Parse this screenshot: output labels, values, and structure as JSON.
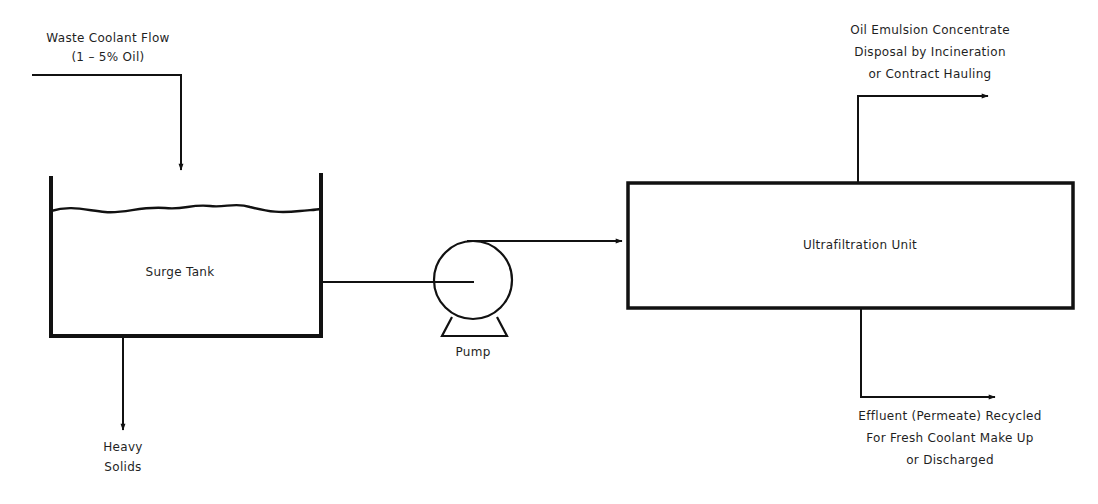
{
  "diagram": {
    "type": "process-flow",
    "colors": {
      "line": "#111111",
      "text": "#1f1f1f",
      "background": "#ffffff"
    },
    "inlet": {
      "label_line1": "Waste Coolant Flow",
      "label_line2": "(1 – 5% Oil)"
    },
    "surge_tank": {
      "label": "Surge Tank"
    },
    "heavy_solids": {
      "label_line1": "Heavy",
      "label_line2": "Solids"
    },
    "pump": {
      "label": "Pump"
    },
    "ultrafiltration": {
      "label": "Ultrafiltration Unit"
    },
    "concentrate_outlet": {
      "label_line1": "Oil Emulsion Concentrate",
      "label_line2": "Disposal by Incineration",
      "label_line3": "or Contract Hauling"
    },
    "permeate_outlet": {
      "label_line1": "Effluent (Permeate) Recycled",
      "label_line2": "For Fresh Coolant Make Up",
      "label_line3": "or Discharged"
    },
    "flows": [
      {
        "from": "Waste Coolant Flow",
        "to": "Surge Tank"
      },
      {
        "from": "Surge Tank",
        "to": "Heavy Solids"
      },
      {
        "from": "Surge Tank",
        "to": "Pump"
      },
      {
        "from": "Pump",
        "to": "Ultrafiltration Unit"
      },
      {
        "from": "Ultrafiltration Unit",
        "to": "Oil Emulsion Concentrate"
      },
      {
        "from": "Ultrafiltration Unit",
        "to": "Effluent (Permeate)"
      }
    ]
  }
}
